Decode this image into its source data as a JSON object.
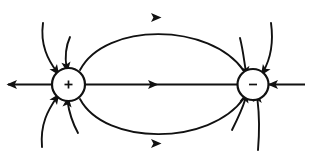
{
  "figure": {
    "background_color": "#ffffff",
    "stroke_color": "#111111",
    "width": 310,
    "height": 163
  },
  "charges": [
    {
      "id": "positive-charge",
      "sign": "+",
      "label": "positive point charge",
      "cx": 68.5,
      "cy": 84.5,
      "r": 16.5
    },
    {
      "id": "negative-charge",
      "sign": "−",
      "label": "negative point charge",
      "cx": 253.0,
      "cy": 84.5,
      "r": 15.5
    }
  ],
  "field_lines": [
    {
      "name": "axis-line-between-charges",
      "kind": "straight",
      "path": "M 85 84.5 L 237.5 84.5",
      "arrow": {
        "x": 152,
        "y": 84.5,
        "angle": 0
      }
    },
    {
      "name": "axis-line-left-outward",
      "kind": "straight",
      "path": "M 52 84.5 L 8 84.5",
      "arrow": {
        "x": 13,
        "y": 84.5,
        "angle": 180
      }
    },
    {
      "name": "axis-line-right-inward",
      "kind": "straight",
      "path": "M 305 84.5 L 269 84.5",
      "arrow": {
        "x": 274,
        "y": 84.5,
        "angle": 180
      }
    },
    {
      "name": "upper-arc-plus-to-minus",
      "kind": "curve",
      "path": "M 80 70 C 105 22, 210 22, 244 71",
      "arrow": {
        "x": 155,
        "y": 17.5,
        "angle": 0
      }
    },
    {
      "name": "lower-arc-plus-to-minus",
      "kind": "curve",
      "path": "M 80 99 C 105 146, 210 146, 244 98",
      "arrow": {
        "x": 155,
        "y": 143.5,
        "angle": 0
      }
    },
    {
      "name": "plus-outward-upper-left-far",
      "kind": "curve",
      "path": "M 43 23 C 40 45, 48 60, 57 72",
      "arrow": {
        "x": 55.5,
        "y": 70,
        "angle": 55
      }
    },
    {
      "name": "plus-outward-upper-left-near",
      "kind": "curve",
      "path": "M 70 37 C 65 48, 65 58, 66.5 68",
      "arrow": {
        "x": 66.5,
        "y": 66,
        "angle": 82
      }
    },
    {
      "name": "plus-outward-lower-left-far",
      "kind": "curve",
      "path": "M 42 147 C 40 124, 48 110, 57 97",
      "arrow": {
        "x": 55.5,
        "y": 99,
        "angle": -55
      }
    },
    {
      "name": "plus-outward-lower-left-near",
      "kind": "curve",
      "path": "M 78 133 C 72 122, 69 112, 67.5 101",
      "arrow": {
        "x": 67.5,
        "y": 103,
        "angle": -83
      }
    },
    {
      "name": "minus-inward-upper-left",
      "kind": "curve",
      "path": "M 240 38 C 243 50, 244 60, 245.5 69",
      "arrow": {
        "x": 245.5,
        "y": 70.5,
        "angle": 81
      }
    },
    {
      "name": "minus-inward-upper-right",
      "kind": "curve",
      "path": "M 271 23 C 274 45, 270 60, 263 72",
      "arrow": {
        "x": 264.5,
        "y": 70,
        "angle": 124
      }
    },
    {
      "name": "minus-inward-lower-left",
      "kind": "curve",
      "path": "M 232 130 C 238 118, 242 110, 245 100",
      "arrow": {
        "x": 245,
        "y": 98.5,
        "angle": -76
      }
    },
    {
      "name": "minus-inward-lower-right",
      "kind": "curve",
      "path": "M 258 150 C 260 126, 259 112, 257.5 100",
      "arrow": {
        "x": 257.5,
        "y": 98.5,
        "angle": -85
      }
    }
  ]
}
